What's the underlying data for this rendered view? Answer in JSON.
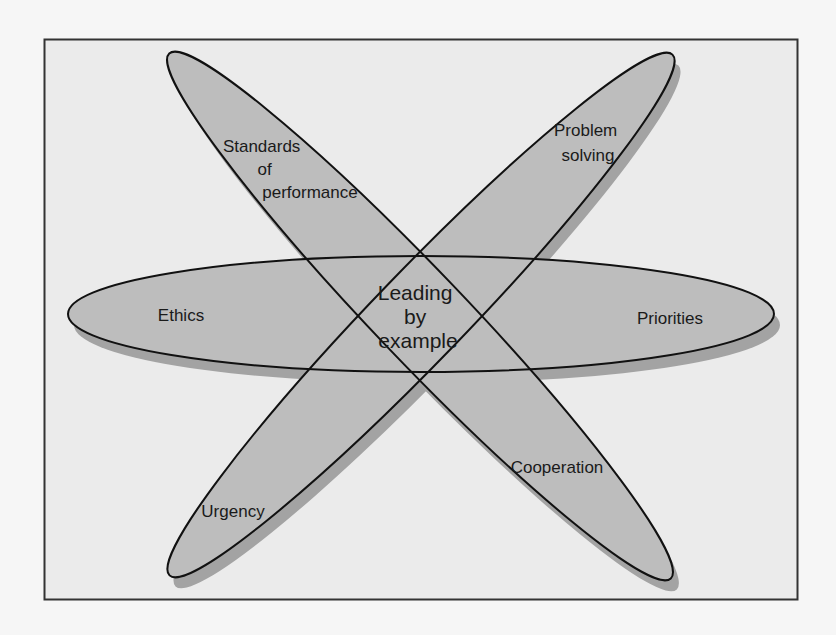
{
  "diagram": {
    "type": "overlapping-ellipses",
    "center": {
      "lines": [
        "Leading",
        "by",
        "example"
      ]
    },
    "petals": [
      {
        "id": "standards",
        "lines": [
          "Standards",
          "of",
          "performance"
        ]
      },
      {
        "id": "problem",
        "lines": [
          "Problem",
          "solving"
        ]
      },
      {
        "id": "ethics",
        "lines": [
          "Ethics"
        ]
      },
      {
        "id": "priorities",
        "lines": [
          "Priorities"
        ]
      },
      {
        "id": "urgency",
        "lines": [
          "Urgency"
        ]
      },
      {
        "id": "cooperation",
        "lines": [
          "Cooperation"
        ]
      }
    ],
    "colors": {
      "background": "#f6f6f6",
      "frame_fill": "#ebebeb",
      "frame_stroke": "#333333",
      "ellipse_fill": "#bdbdbd",
      "shadow_fill": "#a3a3a3",
      "outline": "#111111"
    }
  }
}
